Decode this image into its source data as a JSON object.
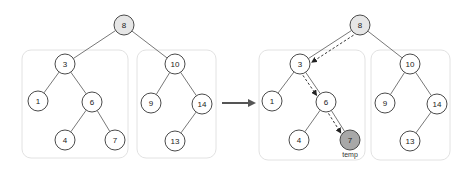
{
  "diagram": {
    "title": "",
    "before": {
      "nodes": [
        {
          "id": "8",
          "label": "8",
          "x": 124,
          "y": 25,
          "style": "root"
        },
        {
          "id": "3",
          "label": "3",
          "x": 65,
          "y": 64,
          "style": "normal"
        },
        {
          "id": "10",
          "label": "10",
          "x": 175,
          "y": 64,
          "style": "normal"
        },
        {
          "id": "1",
          "label": "1",
          "x": 38,
          "y": 101,
          "style": "normal"
        },
        {
          "id": "6",
          "label": "6",
          "x": 92,
          "y": 102,
          "style": "normal"
        },
        {
          "id": "9",
          "label": "9",
          "x": 151,
          "y": 103,
          "style": "normal"
        },
        {
          "id": "14",
          "label": "14",
          "x": 202,
          "y": 104,
          "style": "normal"
        },
        {
          "id": "4",
          "label": "4",
          "x": 65,
          "y": 140,
          "style": "normal"
        },
        {
          "id": "7",
          "label": "7",
          "x": 115,
          "y": 140,
          "style": "normal"
        },
        {
          "id": "13",
          "label": "13",
          "x": 175,
          "y": 141,
          "style": "normal"
        }
      ],
      "edges": [
        [
          "8",
          "3"
        ],
        [
          "8",
          "10"
        ],
        [
          "3",
          "1"
        ],
        [
          "3",
          "6"
        ],
        [
          "6",
          "4"
        ],
        [
          "6",
          "7"
        ],
        [
          "10",
          "9"
        ],
        [
          "10",
          "14"
        ],
        [
          "14",
          "13"
        ]
      ],
      "boxes": [
        {
          "name": "left-subtree",
          "x": 22,
          "y": 50,
          "w": 106,
          "h": 108
        },
        {
          "name": "right-subtree",
          "x": 137,
          "y": 50,
          "w": 79,
          "h": 108
        }
      ]
    },
    "transition_arrow": {
      "x1": 222,
      "y1": 103,
      "x2": 258,
      "y2": 103
    },
    "after": {
      "nodes": [
        {
          "id": "8",
          "label": "8",
          "x": 360,
          "y": 25,
          "style": "root"
        },
        {
          "id": "3",
          "label": "3",
          "x": 300,
          "y": 64,
          "style": "normal"
        },
        {
          "id": "10",
          "label": "10",
          "x": 410,
          "y": 64,
          "style": "normal"
        },
        {
          "id": "1",
          "label": "1",
          "x": 272,
          "y": 101,
          "style": "normal"
        },
        {
          "id": "6",
          "label": "6",
          "x": 326,
          "y": 102,
          "style": "normal"
        },
        {
          "id": "9",
          "label": "9",
          "x": 385,
          "y": 103,
          "style": "normal"
        },
        {
          "id": "14",
          "label": "14",
          "x": 437,
          "y": 104,
          "style": "normal"
        },
        {
          "id": "4",
          "label": "4",
          "x": 299,
          "y": 140,
          "style": "normal"
        },
        {
          "id": "7",
          "label": "7",
          "x": 350,
          "y": 140,
          "style": "temp"
        },
        {
          "id": "13",
          "label": "13",
          "x": 410,
          "y": 141,
          "style": "normal"
        }
      ],
      "edges": [
        [
          "8",
          "3"
        ],
        [
          "8",
          "10"
        ],
        [
          "3",
          "1"
        ],
        [
          "3",
          "6"
        ],
        [
          "6",
          "4"
        ],
        [
          "6",
          "7"
        ],
        [
          "10",
          "9"
        ],
        [
          "10",
          "14"
        ],
        [
          "14",
          "13"
        ]
      ],
      "boxes": [
        {
          "name": "left-subtree",
          "x": 259,
          "y": 50,
          "w": 106,
          "h": 110
        },
        {
          "name": "right-subtree",
          "x": 371,
          "y": 50,
          "w": 79,
          "h": 110
        }
      ],
      "traversal_path": [
        [
          "8",
          "3"
        ],
        [
          "3",
          "6"
        ],
        [
          "6",
          "7"
        ]
      ],
      "temp_label": "temp",
      "temp_node": "7"
    },
    "colors": {
      "root_fill": "#e6e6e6",
      "temp_fill": "#a8a8a8",
      "node_stroke": "#4a4a4a",
      "box_stroke": "#e2e2e2",
      "arrow": "#555555"
    }
  }
}
